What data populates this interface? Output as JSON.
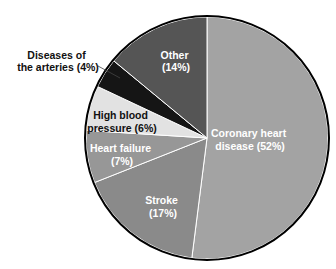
{
  "chart_data": {
    "type": "pie",
    "title": "",
    "start_angle_deg": 0,
    "direction": "clockwise from 12 o'clock",
    "slices": [
      {
        "label": "Coronary heart disease",
        "value": 52,
        "color": "#a3a3a3",
        "text_color": "#ffffff",
        "line1": "Coronary heart",
        "line2": "disease (52%)"
      },
      {
        "label": "Stroke",
        "value": 17,
        "color": "#8a8a8a",
        "text_color": "#ffffff",
        "line1": "Stroke",
        "line2": "(17%)"
      },
      {
        "label": "Heart failure",
        "value": 7,
        "color": "#979797",
        "text_color": "#ffffff",
        "line1": "Heart failure",
        "line2": "(7%)"
      },
      {
        "label": "High blood pressure",
        "value": 6,
        "color": "#e2e2e2",
        "text_color": "#111111",
        "line1": "High blood",
        "line2": "pressure (6%)"
      },
      {
        "label": "Diseases of the arteries",
        "value": 4,
        "color": "#151515",
        "text_color": "#111111",
        "line1": "Diseases of",
        "line2": "the arteries (4%)"
      },
      {
        "label": "Other",
        "value": 14,
        "color": "#555555",
        "text_color": "#ffffff",
        "line1": "Other",
        "line2": "(14%)"
      }
    ]
  }
}
